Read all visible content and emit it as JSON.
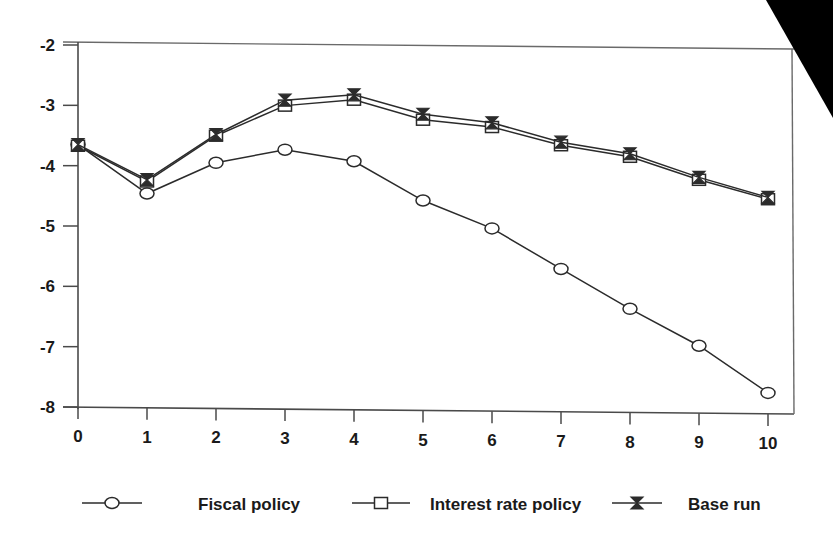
{
  "chart_data": {
    "type": "line",
    "title": "",
    "subtitle": "",
    "xlabel": "",
    "ylabel": "",
    "x": [
      0,
      1,
      2,
      3,
      4,
      5,
      6,
      7,
      8,
      9,
      10
    ],
    "xtick_labels": [
      "0",
      "1",
      "2",
      "3",
      "4",
      "5",
      "6",
      "7",
      "8",
      "9",
      "10"
    ],
    "ytick_labels": [
      "-2",
      "-3",
      "-4",
      "-5",
      "-6",
      "-7",
      "-8"
    ],
    "yticks": [
      -2,
      -3,
      -4,
      -5,
      -6,
      -7,
      -8
    ],
    "xlim": [
      0,
      10
    ],
    "ylim": [
      -8,
      -2
    ],
    "grid": false,
    "legend_position": "bottom",
    "series": [
      {
        "name": "Fiscal policy",
        "marker": "circle",
        "values": [
          -3.65,
          -4.45,
          -3.93,
          -3.7,
          -3.88,
          -4.52,
          -4.97,
          -5.63,
          -6.28,
          -6.88,
          -7.65
        ]
      },
      {
        "name": "Interest rate policy",
        "marker": "square",
        "values": [
          -3.67,
          -4.25,
          -3.48,
          -2.97,
          -2.86,
          -3.18,
          -3.29,
          -3.58,
          -3.76,
          -4.13,
          -4.44
        ]
      },
      {
        "name": "Base run",
        "marker": "bowtie",
        "values": [
          -3.65,
          -4.22,
          -3.46,
          -2.88,
          -2.78,
          -3.09,
          -3.22,
          -3.53,
          -3.71,
          -4.09,
          -4.41
        ]
      }
    ]
  },
  "legend": {
    "items": [
      {
        "label": "Fiscal policy",
        "marker": "circle-marker"
      },
      {
        "label": "Interest rate policy",
        "marker": "square-marker"
      },
      {
        "label": "Base run",
        "marker": "bowtie-marker"
      }
    ]
  },
  "colors": {
    "background": "#ffffff",
    "line": "#2b2b2b",
    "axis": "#4a4a4a",
    "text": "#1a1a1a",
    "artifact": "#000000"
  }
}
